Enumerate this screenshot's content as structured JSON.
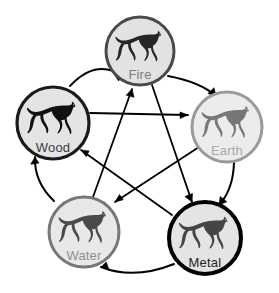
{
  "diagram": {
    "background_color": "#ffffff",
    "canvas": {
      "width": 279,
      "height": 293
    },
    "node_icon": "horse-silhouette-icon",
    "nodes": [
      {
        "id": "fire",
        "label": "Fire",
        "cx": 140,
        "cy": 51,
        "r": 34,
        "fill_color": "#e2e2e2",
        "stroke_color": "#4a4a4a",
        "stroke_width": 3,
        "horse_color": "#262626",
        "label_color": "#7d7d7d",
        "label_dy": 25
      },
      {
        "id": "wood",
        "label": "Wood",
        "cx": 53,
        "cy": 123,
        "r": 36,
        "fill_color": "#e4e4e4",
        "stroke_color": "#1a1a1a",
        "stroke_width": 3.2,
        "horse_color": "#111111",
        "label_color": "#3c3c3c",
        "label_dy": 26
      },
      {
        "id": "earth",
        "label": "Earth",
        "cx": 227,
        "cy": 127,
        "r": 35,
        "fill_color": "#ececec",
        "stroke_color": "#9a9a9a",
        "stroke_width": 3,
        "horse_color": "#777777",
        "label_color": "#a8a8a8",
        "label_dy": 25
      },
      {
        "id": "water",
        "label": "Water",
        "cx": 84,
        "cy": 232,
        "r": 35,
        "fill_color": "#e8e8e8",
        "stroke_color": "#777777",
        "stroke_width": 3,
        "horse_color": "#4a4a4a",
        "label_color": "#8f8f8f",
        "label_dy": 25
      },
      {
        "id": "metal",
        "label": "Metal",
        "cx": 205,
        "cy": 238,
        "r": 36,
        "fill_color": "#e4e4e4",
        "stroke_color": "#000000",
        "stroke_width": 4,
        "horse_color": "#454545",
        "label_color": "#1f1f1f",
        "label_dy": 26
      }
    ],
    "generating_cycle": {
      "name": "generating-cycle",
      "style": "curved-outer-arrow",
      "stroke_color": "#000000",
      "stroke_width": 2,
      "edges": [
        {
          "from": "wood",
          "to": "fire",
          "path": "M 70 86 Q 96 58 123 76",
          "arrow": "M 123 76 l -8.4 -1.2 l 4.0 6.2 z"
        },
        {
          "from": "fire",
          "to": "earth",
          "path": "M 168 76 Q 200 82 216 96",
          "arrow": "M 216 96 l -2.0 -8.3 l -6.1 5.9 z"
        },
        {
          "from": "earth",
          "to": "metal",
          "path": "M 234 163 Q 233 190 219 205",
          "arrow": "M 219 205 l 7.8 -3.2 l -6.6 -5.3 z"
        },
        {
          "from": "metal",
          "to": "water",
          "path": "M 174 264 Q 134 280 101 267",
          "arrow": "M 101 267 l 8.0 2.8 l -2.7 -7.7 z"
        },
        {
          "from": "water",
          "to": "wood",
          "path": "M 54 201 Q 34 182 35 157",
          "arrow": "M 35 157 l -4.3 7.3 l 8.3 -1.2 z"
        }
      ]
    },
    "overcoming_cycle": {
      "name": "overcoming-cycle",
      "style": "straight-inner-arrow",
      "stroke_color": "#000000",
      "stroke_width": 1.8,
      "edges": [
        {
          "from": "wood",
          "to": "earth",
          "path": "M 90 113 L 188 115",
          "arrow": "M 188 115 l -8.0 -3.0 l 0.1 6.4 z"
        },
        {
          "from": "earth",
          "to": "water",
          "path": "M 199 147 L 115 202",
          "arrow": "M 115 202 l 8.2 -2.2 l -3.7 -5.3 z"
        },
        {
          "from": "water",
          "to": "fire",
          "path": "M 93 197 L 132 89",
          "arrow": "M 132 89 l -5.8 6.3 l 7.9 2.0 z"
        },
        {
          "from": "fire",
          "to": "metal",
          "path": "M 152 85 L 192 202",
          "arrow": "M 192 202 l 0.5 -8.5 l -7.6 2.9 z"
        },
        {
          "from": "metal",
          "to": "wood",
          "path": "M 172 215 L 81 150",
          "arrow": "M 81 150 l 5.3 6.7 l 2.8 -5.8 z"
        }
      ]
    }
  }
}
